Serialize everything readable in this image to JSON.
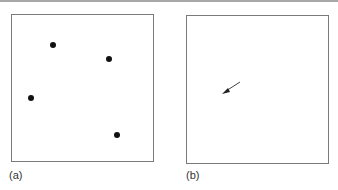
{
  "figure": {
    "panels": [
      {
        "id": "a",
        "label": "(a)",
        "points": [
          {
            "x": 53,
            "y": 45
          },
          {
            "x": 109,
            "y": 59
          },
          {
            "x": 31,
            "y": 98
          },
          {
            "x": 117,
            "y": 135
          }
        ]
      },
      {
        "id": "b",
        "label": "(b)",
        "arrow": {
          "from": [
            240,
            82
          ],
          "to": [
            223,
            93
          ]
        }
      }
    ],
    "colors": {
      "border": "#7a7a7a",
      "point": "#111111",
      "arrow": "#333333"
    }
  }
}
